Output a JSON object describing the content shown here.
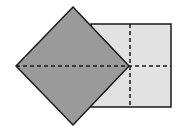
{
  "diagram": {
    "colors": {
      "diamond_fill": "#9a9a9a",
      "rectangle_fill": "#e2e2e2",
      "stroke": "#1a1a1a",
      "background": "#ffffff"
    },
    "rectangle": {
      "x": 91,
      "y": 24,
      "width": 80,
      "height": 83
    },
    "diamond": {
      "top": [
        73,
        7
      ],
      "right": [
        129,
        66
      ],
      "bottom": [
        73,
        125
      ],
      "left": [
        16,
        66
      ]
    },
    "dashed_lines": {
      "horizontal": {
        "x1": 16,
        "y1": 66,
        "x2": 171,
        "y2": 66
      },
      "vertical": {
        "x1": 130,
        "y1": 24,
        "x2": 130,
        "y2": 107
      }
    }
  }
}
